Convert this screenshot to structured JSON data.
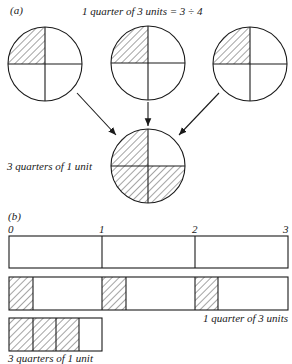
{
  "part_a": {
    "label": "(a)",
    "title": "1 quarter of 3 units = 3 ÷ 4",
    "result_label": "3 quarters of 1 unit",
    "source_circles": [
      {
        "cx": 45,
        "cy": 64,
        "r": 37,
        "shaded_quarter": "top-left"
      },
      {
        "cx": 148,
        "cy": 63,
        "r": 37,
        "shaded_quarter": "top-left"
      },
      {
        "cx": 250,
        "cy": 64,
        "r": 37,
        "shaded_quarter": "top-left"
      }
    ],
    "result_circle": {
      "cx": 148,
      "cy": 166,
      "r": 37,
      "shaded_quarters": [
        "top-left",
        "bottom-left",
        "bottom-right"
      ]
    }
  },
  "part_b": {
    "label": "(b)",
    "ticks": [
      "0",
      "1",
      "2",
      "3"
    ],
    "bar_label_1": "1 quarter of 3 units",
    "bar_label_2": "3 quarters of 1 unit"
  },
  "colors": {
    "ink": "#1a1a1a",
    "background": "#ffffff"
  }
}
